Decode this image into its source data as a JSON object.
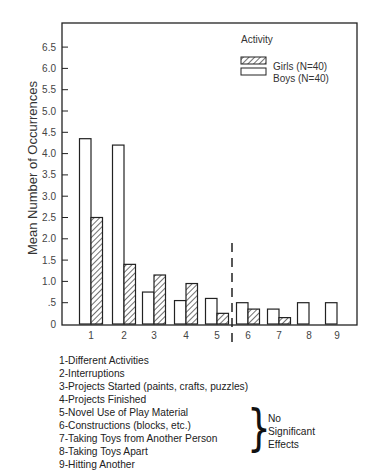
{
  "chart_data": {
    "type": "bar",
    "title": "",
    "xlabel": "",
    "ylabel": "Mean Number of Occurrences",
    "ylim": [
      0,
      6.5
    ],
    "yticks": [
      {
        "value": 0,
        "label": "0"
      },
      {
        "value": 0.5,
        "label": ".5"
      },
      {
        "value": 1.0,
        "label": "1.0"
      },
      {
        "value": 1.5,
        "label": "1.5"
      },
      {
        "value": 2.0,
        "label": "2.0"
      },
      {
        "value": 2.5,
        "label": "2.5"
      },
      {
        "value": 3.0,
        "label": "3.0"
      },
      {
        "value": 3.5,
        "label": "3.5"
      },
      {
        "value": 4.0,
        "label": "4.0"
      },
      {
        "value": 4.5,
        "label": "4.5"
      },
      {
        "value": 5.0,
        "label": "5.0"
      },
      {
        "value": 5.5,
        "label": "5.5"
      },
      {
        "value": 6.0,
        "label": "6.0"
      },
      {
        "value": 6.5,
        "label": "6.5"
      }
    ],
    "grid": false,
    "categories": [
      "1",
      "2",
      "3",
      "4",
      "5",
      "6",
      "7",
      "8",
      "9"
    ],
    "series": [
      {
        "name": "Boys (N=40)",
        "pattern": "open",
        "values": [
          4.35,
          4.2,
          0.75,
          0.55,
          0.6,
          0.5,
          0.35,
          0.5,
          0.5
        ]
      },
      {
        "name": "Girls (N=40)",
        "pattern": "hatched",
        "values": [
          2.5,
          1.4,
          1.15,
          0.95,
          0.25,
          0.35,
          0.15,
          0,
          0
        ]
      }
    ],
    "legend": {
      "title": "Activity",
      "position": "top-right",
      "entries": [
        {
          "label": "Girls (N=40)",
          "pattern": "hatched"
        },
        {
          "label": "Boys (N=40)",
          "pattern": "open"
        }
      ]
    },
    "annotations": [
      {
        "type": "dashed-vertical-line",
        "between_categories": [
          "5",
          "6"
        ],
        "meaning": "separates significant from non-significant effects"
      }
    ]
  },
  "category_key": [
    "1-Different Activities",
    "2-Interruptions",
    "3-Projects Started (paints, crafts, puzzles)",
    "4-Projects Finished",
    "5-Novel Use of Play Material",
    "6-Constructions (blocks, etc.)",
    "7-Taking Toys from Another Person",
    "8-Taking Toys Apart",
    "9-Hitting Another"
  ],
  "brace_note": {
    "lines": [
      "No",
      "Significant",
      "Effects"
    ]
  },
  "colors": {
    "axis": "#222222",
    "bar_stroke": "#222222",
    "bar_fill_open": "#ffffff",
    "hatch": "#333333"
  }
}
